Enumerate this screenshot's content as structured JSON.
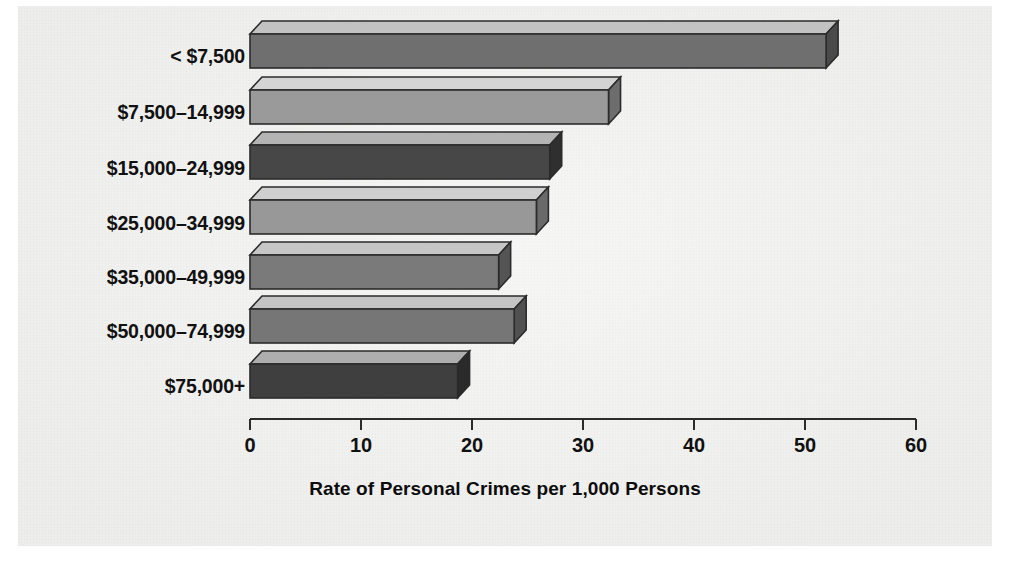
{
  "chart_data": {
    "type": "bar",
    "orientation": "horizontal",
    "title": "",
    "xlabel": "Rate of Personal Crimes per 1,000 Persons",
    "ylabel": "",
    "categories": [
      "< $7,500",
      "$7,500–14,999",
      "$15,000–24,999",
      "$25,000–34,999",
      "$35,000–49,999",
      "$50,000–74,999",
      "$75,000+"
    ],
    "values": [
      51.9,
      32.3,
      27.0,
      25.8,
      22.4,
      23.8,
      18.7
    ],
    "xlim": [
      0,
      60
    ],
    "xticks": [
      0,
      10,
      20,
      30,
      40,
      50,
      60
    ],
    "xtick_labels": [
      "0",
      "10",
      "20",
      "30",
      "40",
      "50",
      "60"
    ],
    "grid": false,
    "legend": null,
    "style": "3d-shaded-bars",
    "bar_colors": [
      "#6f6f6f",
      "#9a9a9a",
      "#474747",
      "#989898",
      "#7a7a7a",
      "#767676",
      "#3f3f3f"
    ],
    "bar_top_colors": [
      "#c2c2c2",
      "#d4d4d4",
      "#b4b4b4",
      "#cfcfcf",
      "#c6c6c6",
      "#c4c4c4",
      "#aeaeae"
    ],
    "bar_side_colors": [
      "#4a4a4a",
      "#6d6d6d",
      "#2f2f2f",
      "#6a6a6a",
      "#545454",
      "#505050",
      "#2a2a2a"
    ]
  },
  "axis": {
    "line_color": "#2b2b2b",
    "origin_label": "0",
    "max_label": "60"
  },
  "page": {
    "background": "#f2f2f1",
    "ink": "#111111"
  }
}
